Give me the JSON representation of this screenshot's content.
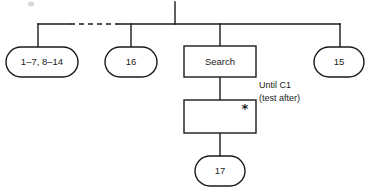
{
  "diagram": {
    "type": "hierarchy-tree",
    "title": "",
    "root_stem": {
      "name": "parent-stem",
      "label": ""
    },
    "bus": {
      "label": "",
      "has_dashed_segment": true
    },
    "nodes": [
      {
        "id": "node-range",
        "shape": "stadium",
        "label": "1–7, 8–14"
      },
      {
        "id": "node-16",
        "shape": "stadium",
        "label": "16"
      },
      {
        "id": "node-search",
        "shape": "rectangle",
        "label": "Search"
      },
      {
        "id": "node-15",
        "shape": "stadium",
        "label": "15"
      },
      {
        "id": "node-loop",
        "shape": "rectangle",
        "label": "",
        "marker": "*"
      },
      {
        "id": "node-17",
        "shape": "stadium",
        "label": "17"
      }
    ],
    "annotation": {
      "line1": "Until C1",
      "line2": "(test after)"
    },
    "colors": {
      "stroke": "#1a1a1a",
      "fill": "#ffffff",
      "background": "#ffffff"
    }
  }
}
